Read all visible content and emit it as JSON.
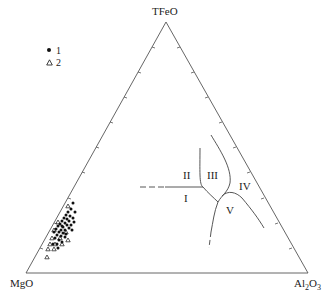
{
  "diagram": {
    "type": "ternary",
    "vertices": {
      "top": "TFeO",
      "left": "MgO",
      "right_base": "Al",
      "right_sub1": "2",
      "right_mid": "O",
      "right_sub2": "3"
    },
    "legend": {
      "items": [
        {
          "symbol": "filled-circle",
          "label": "1"
        },
        {
          "symbol": "open-triangle",
          "label": "2"
        }
      ]
    },
    "regions": {
      "r1": "I",
      "r2": "II",
      "r3": "III",
      "r4": "IV",
      "r5": "V"
    },
    "colors": {
      "axis": "#555555",
      "boundary": "#444444",
      "points": "#111111",
      "text": "#222222"
    }
  }
}
